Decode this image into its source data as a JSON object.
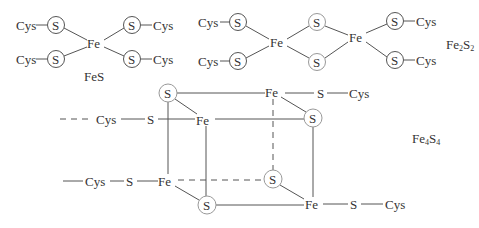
{
  "diagram": {
    "atoms": {
      "cys": "Cys",
      "s": "S",
      "fe": "Fe"
    },
    "clusters": [
      {
        "id": "fes",
        "label": "FeS"
      },
      {
        "id": "fe2s2",
        "label_base1": "Fe",
        "label_sub1": "2",
        "label_base2": "S",
        "label_sub2": "2"
      },
      {
        "id": "fe4s4",
        "label_base1": "Fe",
        "label_sub1": "4",
        "label_base2": "S",
        "label_sub2": "4"
      }
    ],
    "colors": {
      "line": "#555555",
      "text": "#333333",
      "bridging_circle": "#999999",
      "background": "#ffffff"
    }
  }
}
